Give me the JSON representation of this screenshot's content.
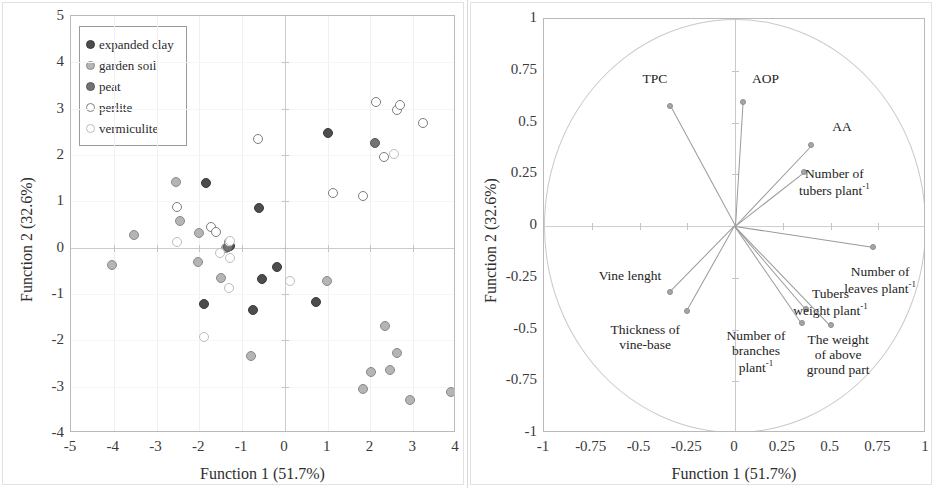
{
  "figure": {
    "panels": [
      "scores-scatter",
      "loadings-biplot"
    ]
  },
  "left_panel": {
    "xlabel": "Function 1 (51.7%)",
    "ylabel": "Function 2 (32.6%)",
    "xticks": [
      "-5",
      "-4",
      "-3",
      "-2",
      "-1",
      "0",
      "1",
      "2",
      "3",
      "4"
    ],
    "yticks": [
      "5",
      "4",
      "3",
      "2",
      "1",
      "0",
      "-1",
      "-2",
      "-3",
      "-4"
    ],
    "legend": {
      "items": [
        {
          "label": "expanded clay",
          "fill": "#4d4d4d",
          "stroke": "#3a3a3a"
        },
        {
          "label": "garden soil",
          "fill": "#b5b5b5",
          "stroke": "#8a8a8a"
        },
        {
          "label": "peat",
          "fill": "#737373",
          "stroke": "#555555"
        },
        {
          "label": "perlite",
          "fill": "#ffffff",
          "stroke": "#7d7d7d"
        },
        {
          "label": "vermiculite",
          "fill": "#ffffff",
          "stroke": "#bdbdbd"
        }
      ]
    }
  },
  "right_panel": {
    "xlabel": "Function 1 (51.7%)",
    "ylabel": "Function 2 (32.6%)",
    "xticks": [
      "-1",
      "-0.75",
      "-0.5",
      "-0.25",
      "0",
      "0.25",
      "0.5",
      "0.75",
      "1"
    ],
    "yticks": [
      "1",
      "0.75",
      "0.5",
      "0.25",
      "0",
      "-0.25",
      "-0.5",
      "-0.75",
      "-1"
    ]
  },
  "chart_data": [
    {
      "type": "scatter",
      "title": "",
      "xlabel": "Function 1 (51.7%)",
      "ylabel": "Function 2 (32.6%)",
      "xlim": [
        -5,
        4
      ],
      "ylim": [
        -4,
        5
      ],
      "grid": true,
      "legend_position": "top-left",
      "series": [
        {
          "name": "expanded clay",
          "fill": "#4d4d4d",
          "stroke": "#3a3a3a",
          "points": [
            [
              -1.85,
              1.4
            ],
            [
              -0.6,
              0.86
            ],
            [
              1.0,
              2.47
            ],
            [
              -1.9,
              -1.22
            ],
            [
              -0.75,
              -1.35
            ],
            [
              -0.53,
              -0.68
            ],
            [
              -0.18,
              -0.42
            ],
            [
              0.72,
              -1.17
            ],
            [
              -1.28,
              0.03
            ]
          ]
        },
        {
          "name": "garden soil",
          "fill": "#b5b5b5",
          "stroke": "#8a8a8a",
          "points": [
            [
              -2.55,
              1.42
            ],
            [
              -2.45,
              0.58
            ],
            [
              -2.0,
              0.32
            ],
            [
              -3.52,
              0.28
            ],
            [
              -4.05,
              -0.38
            ],
            [
              -2.03,
              -0.31
            ],
            [
              -1.38,
              0.0
            ],
            [
              -1.5,
              -0.66
            ],
            [
              -0.8,
              -2.33
            ],
            [
              0.98,
              -0.72
            ],
            [
              1.82,
              -3.05
            ],
            [
              2.02,
              -2.69
            ],
            [
              2.35,
              -1.7
            ],
            [
              2.45,
              -2.63
            ],
            [
              2.62,
              -2.28
            ],
            [
              2.92,
              -3.28
            ],
            [
              3.88,
              -3.12
            ]
          ]
        },
        {
          "name": "peat",
          "fill": "#737373",
          "stroke": "#555555",
          "points": [
            [
              -1.33,
              0.02
            ],
            [
              2.1,
              2.25
            ]
          ]
        },
        {
          "name": "perlite",
          "fill": "#ffffff",
          "stroke": "#7d7d7d",
          "points": [
            [
              -2.52,
              0.88
            ],
            [
              -1.72,
              0.44
            ],
            [
              -1.3,
              0.12
            ],
            [
              -1.62,
              0.33
            ],
            [
              -0.62,
              2.35
            ],
            [
              1.12,
              1.17
            ],
            [
              1.83,
              1.12
            ],
            [
              2.12,
              3.15
            ],
            [
              2.32,
              1.95
            ],
            [
              2.62,
              2.98
            ],
            [
              2.7,
              3.08
            ],
            [
              3.22,
              2.7
            ]
          ]
        },
        {
          "name": "vermiculite",
          "fill": "#ffffff",
          "stroke": "#bdbdbd",
          "points": [
            [
              -2.52,
              0.12
            ],
            [
              -1.28,
              -0.22
            ],
            [
              -1.3,
              -0.88
            ],
            [
              -1.88,
              -1.93
            ],
            [
              -1.28,
              0.14
            ],
            [
              0.12,
              -0.73
            ],
            [
              2.55,
              2.02
            ],
            [
              -1.52,
              -0.12
            ]
          ]
        }
      ]
    },
    {
      "type": "scatter",
      "title": "",
      "xlabel": "Function 1 (51.7%)",
      "ylabel": "Function 2 (32.6%)",
      "xlim": [
        -1,
        1
      ],
      "ylim": [
        -1,
        1
      ],
      "grid": true,
      "unit_circle": true,
      "vectors": [
        {
          "label": "TPC",
          "x": -0.34,
          "y": 0.58,
          "label_x": -0.42,
          "label_y": 0.71,
          "align": "ctr"
        },
        {
          "label": "AOP",
          "x": 0.04,
          "y": 0.6,
          "label_x": 0.16,
          "label_y": 0.71,
          "align": "ctr"
        },
        {
          "label": "AA",
          "x": 0.4,
          "y": 0.39,
          "label_x": 0.56,
          "label_y": 0.48,
          "align": "ctr"
        },
        {
          "label": "Number of tubers plant",
          "sup": "-1",
          "x": 0.36,
          "y": 0.26,
          "label_x": 0.52,
          "label_y": 0.25,
          "align": "ctr"
        },
        {
          "label": "Number of leaves plant",
          "sup": "-1",
          "x": 0.72,
          "y": -0.1,
          "label_x": 0.76,
          "label_y": -0.22,
          "align": "ctr"
        },
        {
          "label": "Tubers weight plant",
          "sup": "-1",
          "x": 0.37,
          "y": -0.4,
          "label_x": 0.5,
          "label_y": -0.33,
          "align": "ctr"
        },
        {
          "label": "The weight of above ground part",
          "x": 0.5,
          "y": -0.48,
          "label_x": 0.54,
          "label_y": -0.55,
          "align": "ctr"
        },
        {
          "label": "Number of branches plant",
          "sup": "-1",
          "x": 0.35,
          "y": -0.47,
          "label_x": 0.11,
          "label_y": -0.53,
          "align": "ctr"
        },
        {
          "label": "Vine lenght",
          "x": -0.34,
          "y": -0.32,
          "label_x": -0.55,
          "label_y": -0.24,
          "align": "ctr"
        },
        {
          "label": "Thickness of vine-base",
          "x": -0.25,
          "y": -0.41,
          "label_x": -0.47,
          "label_y": -0.5,
          "align": "ctr"
        }
      ]
    }
  ]
}
